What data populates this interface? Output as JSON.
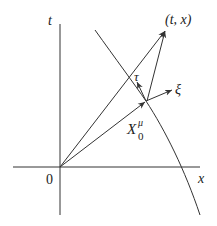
{
  "diagram": {
    "axes": {
      "horizontal_label": "x",
      "vertical_label": "t",
      "origin_label": "0"
    },
    "point_label": "(t, x)",
    "vectors": {
      "tau": "τ",
      "xi": "ξ",
      "x0_base": "X",
      "x0_sup": "μ",
      "x0_sub": "0"
    },
    "colors": {
      "line": "#333333",
      "background": "#ffffff"
    }
  }
}
